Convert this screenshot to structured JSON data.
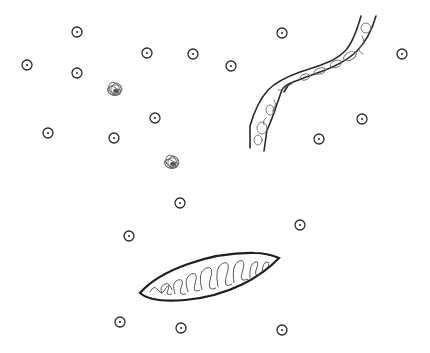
{
  "diagram": {
    "title": "",
    "background": "#ffffff",
    "stroke_color": "#2a2a2a",
    "light_stroke_color": "#6a6a6a",
    "cells": [
      {
        "x": 77,
        "y": 32
      },
      {
        "x": 27,
        "y": 65
      },
      {
        "x": 77,
        "y": 73
      },
      {
        "x": 147,
        "y": 53
      },
      {
        "x": 193,
        "y": 54
      },
      {
        "x": 231,
        "y": 66
      },
      {
        "x": 282,
        "y": 33
      },
      {
        "x": 402,
        "y": 54
      },
      {
        "x": 155,
        "y": 118
      },
      {
        "x": 48,
        "y": 133
      },
      {
        "x": 114,
        "y": 138
      },
      {
        "x": 319,
        "y": 139
      },
      {
        "x": 362,
        "y": 119
      },
      {
        "x": 180,
        "y": 203
      },
      {
        "x": 129,
        "y": 236
      },
      {
        "x": 300,
        "y": 225
      },
      {
        "x": 120,
        "y": 322
      },
      {
        "x": 181,
        "y": 328
      },
      {
        "x": 282,
        "y": 330
      }
    ],
    "clusters": [
      {
        "x": 115,
        "y": 90
      },
      {
        "x": 172,
        "y": 163
      }
    ],
    "vessel": {
      "label": ""
    },
    "elongated_body": {
      "label": ""
    }
  }
}
